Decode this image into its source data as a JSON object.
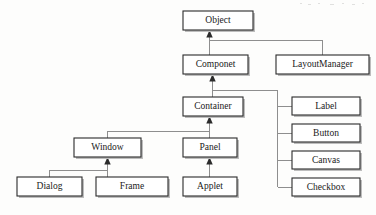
{
  "diagram": {
    "type": "class-hierarchy",
    "background_color": "#fdfdfc",
    "box_fill": "#ffffff",
    "box_stroke": "#2b2b2b",
    "edge_color": "#8e8e8e",
    "text_color": "#1a1a1a",
    "nodes": [
      {
        "id": "object",
        "label": "Object",
        "x": 183,
        "y": 11,
        "w": 70,
        "h": 19
      },
      {
        "id": "componet",
        "label": "Componet",
        "x": 183,
        "y": 55,
        "w": 65,
        "h": 19
      },
      {
        "id": "layoutmanager",
        "label": "LayoutManager",
        "x": 276,
        "y": 55,
        "w": 93,
        "h": 19
      },
      {
        "id": "container",
        "label": "Container",
        "x": 183,
        "y": 97,
        "w": 60,
        "h": 19
      },
      {
        "id": "label",
        "label": "Label",
        "x": 292,
        "y": 97,
        "w": 68,
        "h": 18
      },
      {
        "id": "button",
        "label": "Button",
        "x": 292,
        "y": 124,
        "w": 68,
        "h": 18
      },
      {
        "id": "canvas",
        "label": "Canvas",
        "x": 292,
        "y": 151,
        "w": 68,
        "h": 18
      },
      {
        "id": "checkbox",
        "label": "Checkbox",
        "x": 292,
        "y": 178,
        "w": 68,
        "h": 18
      },
      {
        "id": "window",
        "label": "Window",
        "x": 74,
        "y": 138,
        "w": 67,
        "h": 19
      },
      {
        "id": "panel",
        "label": "Panel",
        "x": 183,
        "y": 138,
        "w": 54,
        "h": 19
      },
      {
        "id": "dialog",
        "label": "Dialog",
        "x": 17,
        "y": 177,
        "w": 65,
        "h": 19
      },
      {
        "id": "frame",
        "label": "Frame",
        "x": 96,
        "y": 177,
        "w": 72,
        "h": 19
      },
      {
        "id": "applet",
        "label": "Applet",
        "x": 183,
        "y": 177,
        "w": 54,
        "h": 19
      }
    ],
    "edges": [
      {
        "id": "componet-to-object",
        "from": "componet",
        "to": "object"
      },
      {
        "id": "layoutmanager-to-object",
        "from": "layoutmanager",
        "to": "object"
      },
      {
        "id": "container-to-componet",
        "from": "container",
        "to": "componet"
      },
      {
        "id": "label-to-container",
        "from": "label",
        "to": "container"
      },
      {
        "id": "button-to-container",
        "from": "button",
        "to": "container"
      },
      {
        "id": "canvas-to-container",
        "from": "canvas",
        "to": "container"
      },
      {
        "id": "checkbox-to-container",
        "from": "checkbox",
        "to": "container"
      },
      {
        "id": "window-to-container",
        "from": "window",
        "to": "container"
      },
      {
        "id": "panel-to-container",
        "from": "panel",
        "to": "container"
      },
      {
        "id": "dialog-to-window",
        "from": "dialog",
        "to": "window"
      },
      {
        "id": "frame-to-window",
        "from": "frame",
        "to": "window"
      },
      {
        "id": "applet-to-panel",
        "from": "applet",
        "to": "panel"
      }
    ]
  }
}
